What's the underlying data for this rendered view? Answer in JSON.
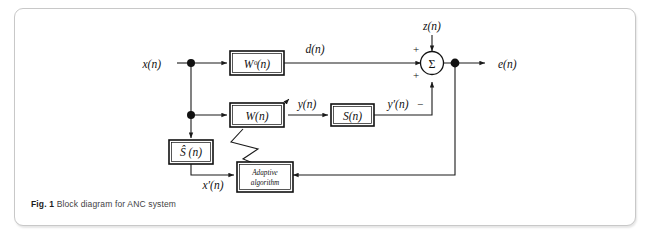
{
  "figure": {
    "caption_label": "Fig. 1",
    "caption_text": "Block diagram for ANC system"
  },
  "diagram": {
    "title": "Block diagram for ANC system",
    "blocks": [
      {
        "id": "w-optimal",
        "label": "Wᵒ(n)",
        "name": "block-w-optimal"
      },
      {
        "id": "w-adaptive",
        "label": "W(n)",
        "name": "block-w-adaptive"
      },
      {
        "id": "s-path",
        "label": "S(n)",
        "name": "block-s-path"
      },
      {
        "id": "s-hat",
        "label": "Ŝ (n)",
        "name": "block-s-hat-estimate"
      },
      {
        "id": "adaptive-algorithm",
        "label_line1": "Adaptive",
        "label_line2": "algorithm",
        "name": "block-adaptive-algorithm"
      }
    ],
    "signals": [
      {
        "id": "x",
        "label": "x(n)",
        "name": "signal-x"
      },
      {
        "id": "d",
        "label": "d(n)",
        "name": "signal-d"
      },
      {
        "id": "z",
        "label": "z(n)",
        "name": "signal-z"
      },
      {
        "id": "e",
        "label": "e(n)",
        "name": "signal-e"
      },
      {
        "id": "y",
        "label": "y(n)",
        "name": "signal-y"
      },
      {
        "id": "y-prime",
        "label": "y′(n)",
        "name": "signal-y-prime"
      },
      {
        "id": "x-prime",
        "label": "x′(n)",
        "name": "signal-x-prime"
      }
    ],
    "summing_junction": {
      "glyph": "Σ",
      "sign_top": "+",
      "sign_left": "+",
      "sign_bottom": "−"
    },
    "colors": {
      "line": "#1a1a1a",
      "block_fill": "#ffffff",
      "card_border": "#c8c8c8",
      "caption_text": "#3f3f3f",
      "background": "#ffffff"
    }
  }
}
